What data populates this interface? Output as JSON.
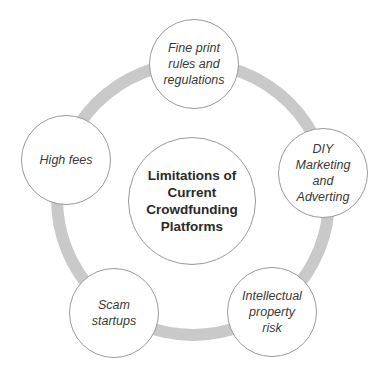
{
  "diagram": {
    "type": "cycle",
    "center": {
      "label": "Limitations of\nCurrent\nCrowdfunding\nPlatforms"
    },
    "nodes": [
      {
        "label": "Fine print\nrules and\nregulations"
      },
      {
        "label": "DIY\nMarketing\nand\nAdverting"
      },
      {
        "label": "Intellectual\nproperty\nrisk"
      },
      {
        "label": "Scam\nstartups"
      },
      {
        "label": "High fees"
      }
    ],
    "colors": {
      "ring": "#c9c9c9",
      "border": "#9a9a9a",
      "text": "#3a3a3a",
      "background": "#ffffff"
    }
  }
}
